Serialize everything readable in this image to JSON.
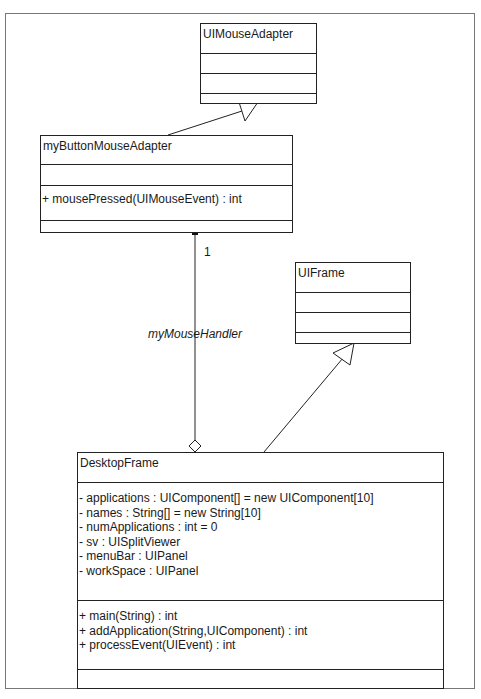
{
  "classes": {
    "ui_mouse_adapter": {
      "name": "UIMouseAdapter",
      "attributes": [],
      "operations": []
    },
    "my_button_mouse_adapter": {
      "name": "myButtonMouseAdapter",
      "attributes": [],
      "operations": [
        "+ mousePressed(UIMouseEvent) : int"
      ]
    },
    "ui_frame": {
      "name": "UIFrame",
      "attributes": [],
      "operations": []
    },
    "desktop_frame": {
      "name": "DesktopFrame",
      "attributes": [
        "- applications : UIComponent[] = new UIComponent[10]",
        "- names : String[] = new String[10]",
        "- numApplications : int = 0",
        "- sv : UISplitViewer",
        "- menuBar : UIPanel",
        "- workSpace : UIPanel"
      ],
      "operations": [
        "+ main(String) : int",
        "+ addApplication(String,UIComponent) : int",
        "+ processEvent(UIEvent) : int"
      ]
    }
  },
  "relationships": {
    "generalization_1": {
      "from": "myButtonMouseAdapter",
      "to": "UIMouseAdapter",
      "type": "generalization"
    },
    "generalization_2": {
      "from": "DesktopFrame",
      "to": "UIFrame",
      "type": "generalization"
    },
    "aggregation": {
      "from": "DesktopFrame",
      "to": "myButtonMouseAdapter",
      "type": "aggregation",
      "role": "myMouseHandler",
      "multiplicity": "1"
    }
  },
  "colors": {
    "line": "#222222",
    "frame": "#777777",
    "background": "#ffffff"
  }
}
